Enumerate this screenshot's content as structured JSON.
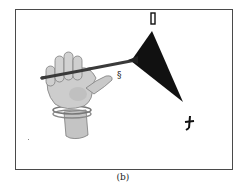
{
  "figure": {
    "caption": "(b)",
    "colors": {
      "frame": "#4a4a4a",
      "triangle": "#111111",
      "rod": "#3a3a3a",
      "hand": "#c9c9c9",
      "hand_shadow": "#8a8a8a",
      "background": "#ffffff"
    },
    "markers": [
      {
        "name": "top-marker",
        "glyph": "rectangle"
      },
      {
        "name": "rod-marker",
        "glyph": "§"
      },
      {
        "name": "bottom-marker",
        "glyph": "t"
      }
    ]
  }
}
